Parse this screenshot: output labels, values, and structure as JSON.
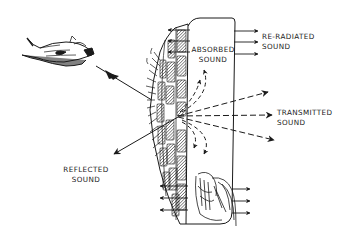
{
  "diagram": {
    "source": {
      "kind": "aircraft",
      "icon": "airplane-icon"
    },
    "labels": {
      "absorbed": [
        "ABSORBED",
        "SOUND"
      ],
      "reradiated": [
        "RE-RADIATED",
        "SOUND"
      ],
      "transmitted": [
        "TRANSMITTED",
        "SOUND"
      ],
      "reflected": [
        "REFLECTED",
        "SOUND"
      ]
    },
    "colors": {
      "ink": "#1a1a1a",
      "background": "#ffffff"
    },
    "components": [
      "incident-sound-ray",
      "brick-wall",
      "interior-room",
      "absorbed-sound-curves",
      "transmitted-rays",
      "reflected-ray",
      "reradiated-arrows-top",
      "reradiated-arrows-bottom",
      "bush-vegetation"
    ]
  }
}
